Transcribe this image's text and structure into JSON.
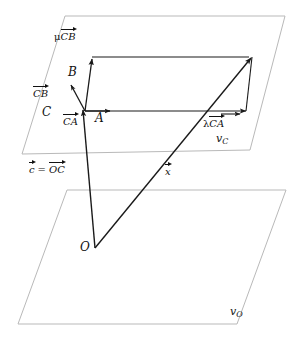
{
  "figure": {
    "colors": {
      "plane_stroke": "#b9b9b9",
      "vector_stroke": "#1a1a1a",
      "label_color": "#111111",
      "background": "#ffffff"
    },
    "planes": [
      {
        "id": "plane-upper",
        "label": "v",
        "label_sub": "C",
        "label_x": 216,
        "label_y": 139,
        "points": "65,16 285,16 250,150 22,154"
      },
      {
        "id": "plane-lower",
        "label": "v",
        "label_sub": "O",
        "label_x": 230,
        "label_y": 312,
        "points": "67,190 286,190 237,324 18,324"
      }
    ],
    "points": [
      {
        "id": "point-C",
        "label": "C",
        "x": 42,
        "y": 113
      },
      {
        "id": "point-A",
        "label": "A",
        "x": 95,
        "y": 117
      },
      {
        "id": "point-B",
        "label": "B",
        "x": 68,
        "y": 73
      },
      {
        "id": "point-O",
        "label": "O",
        "x": 80,
        "y": 247
      }
    ],
    "vector_labels": [
      {
        "id": "label-mu-CB",
        "prefix": "μ",
        "name": "CB",
        "x": 55,
        "y": 38
      },
      {
        "id": "label-CB",
        "prefix": "",
        "name": "CB",
        "x": 40,
        "y": 95
      },
      {
        "id": "label-CA",
        "prefix": "",
        "name": "CA",
        "x": 64,
        "y": 122
      },
      {
        "id": "label-lambda-CA",
        "prefix": "λ",
        "name": "CA",
        "x": 204,
        "y": 124
      },
      {
        "id": "label-c-equals-OC",
        "prefix": "",
        "name": "c",
        "equals": "=",
        "name2": "OC",
        "x": 30,
        "y": 170
      },
      {
        "id": "label-x",
        "prefix": "",
        "name": "x",
        "x": 166,
        "y": 172
      }
    ],
    "arrows": [
      {
        "id": "arrow-CB",
        "from": [
          85,
          111
        ],
        "to": [
          70,
          83
        ]
      },
      {
        "id": "arrow-mu-CB",
        "from": [
          85,
          111
        ],
        "to": [
          92,
          57
        ]
      },
      {
        "id": "arrow-CA",
        "from": [
          85,
          111
        ],
        "to": [
          116,
          111
        ]
      },
      {
        "id": "arrow-CA-full",
        "from": [
          85,
          111
        ],
        "to": [
          247,
          111
        ]
      },
      {
        "id": "arrow-lambda-CA",
        "from": [
          222,
          113
        ],
        "to": [
          243,
          113
        ]
      },
      {
        "id": "arrow-c-OC",
        "from": [
          95,
          248
        ],
        "to": [
          84,
          108
        ]
      },
      {
        "id": "arrow-x",
        "from": [
          95,
          248
        ],
        "to": [
          253,
          56
        ]
      },
      {
        "id": "arrow-parallel-side",
        "from": [
          92,
          57
        ],
        "to": [
          248,
          57
        ]
      },
      {
        "id": "arrow-diagonal-side",
        "from": [
          246,
          111
        ],
        "to": [
          250,
          60
        ]
      }
    ]
  }
}
